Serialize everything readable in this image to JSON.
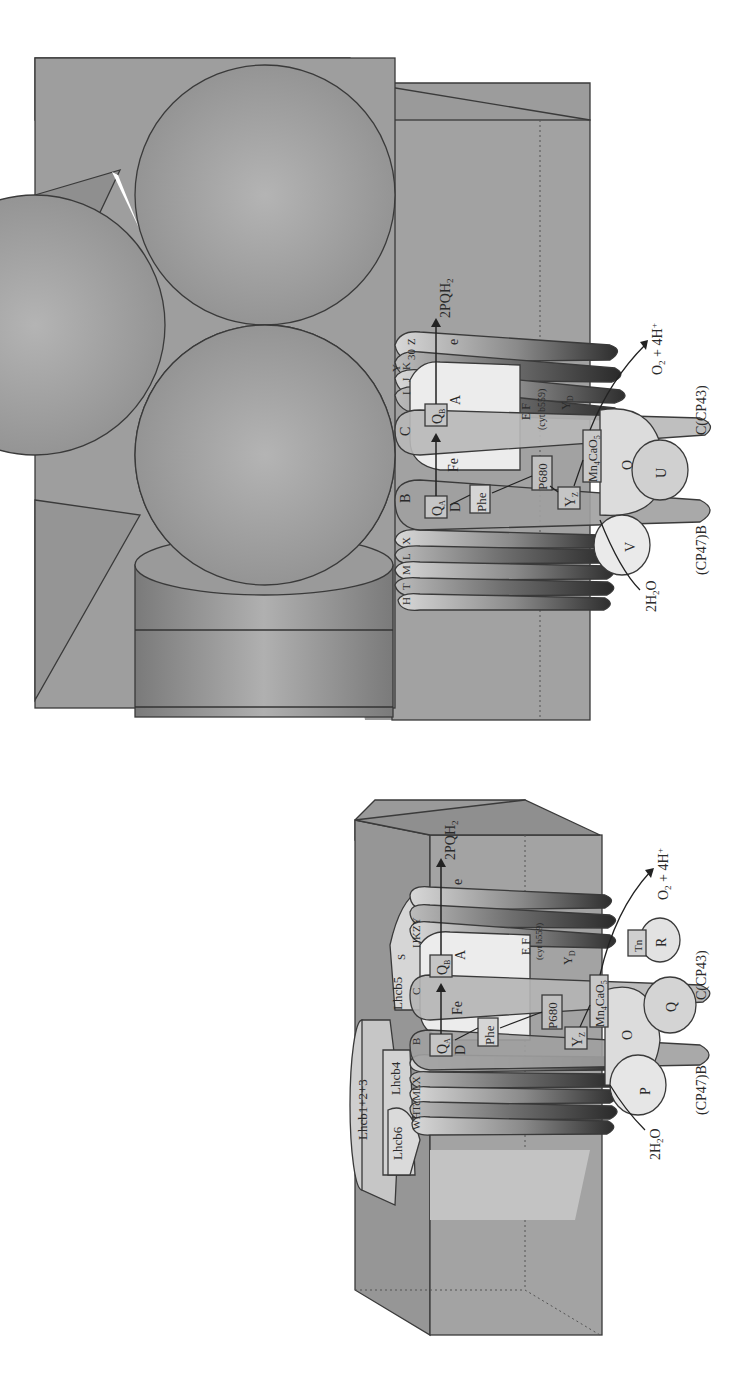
{
  "figure": {
    "orientation": "rotated-90-ccw",
    "panels": [
      {
        "id": "lower-panel",
        "title": "PSII core with LHCII antenna",
        "antenna_labels": [
          "Lhcb1+2+3",
          "Lhcb4",
          "Lhcb5",
          "Lhcb6"
        ],
        "subunit_labels": [
          "W",
          "H",
          "Tc",
          "M",
          "L",
          "X",
          "B",
          "C",
          "S",
          "I",
          "J",
          "K",
          "Z",
          "Y"
        ],
        "cofactor_labels": {
          "qa": "Q",
          "qa_sub": "A",
          "qb": "Q",
          "qb_sub": "B",
          "d2": "D",
          "d2_sub": "(D2)",
          "d1": "A",
          "d1_sub": "(D1)",
          "phe": "Phe",
          "fe": "Fe",
          "p680": "P680",
          "yz": "Y",
          "yz_sub": "Z",
          "yd": "Y",
          "yd_sub": "D",
          "mn": "Mn",
          "mn_sub": "4",
          "mn_rest": "CaO",
          "mn_rest_sub": "5",
          "electron": "e",
          "cytb559": "E F",
          "cytb559_sub": "(cyt b559)"
        },
        "extrinsic_labels": [
          "O",
          "P",
          "Q",
          "R",
          "Tn"
        ],
        "annotations": {
          "product": "2PQH",
          "product_sub": "2",
          "electron": "e",
          "water": "2H",
          "water_sub": "2",
          "water_end": "O",
          "oxygen": "O",
          "oxygen_sub": "2",
          "oxygen_end": " + 4H",
          "oxygen_sup": "+",
          "cp43": "C(CP43)",
          "cp47": "(CP47)B"
        }
      },
      {
        "id": "upper-panel",
        "title": "PSII core with bound spheres",
        "subunit_labels": [
          "H",
          "T",
          "M",
          "L",
          "X",
          "B",
          "C",
          "I",
          "J",
          "K",
          "30",
          "Y",
          "Z"
        ],
        "cofactor_labels": {
          "qa": "Q",
          "qa_sub": "A",
          "qb": "Q",
          "qb_sub": "B",
          "d2": "D",
          "d2_sub": "(D2)",
          "d1": "A",
          "d1_sub": "(D1)",
          "phe": "Phe",
          "fe": "Fe",
          "p680": "P680",
          "yz": "Y",
          "yz_sub": "Z",
          "yd": "Y",
          "yd_sub": "D",
          "mn": "Mn",
          "mn_sub": "4",
          "mn_rest": "CaO",
          "mn_rest_sub": "5",
          "electron": "e",
          "cytb559": "E F",
          "cytb559_sub": "(cyt b559)"
        },
        "extrinsic_labels": [
          "O",
          "U",
          "V"
        ],
        "annotations": {
          "product": "2PQH",
          "product_sub": "2",
          "electron": "e",
          "water": "2H",
          "water_sub": "2",
          "water_end": "O",
          "oxygen": "O",
          "oxygen_sub": "2",
          "oxygen_end": " + 4H",
          "oxygen_sup": "+",
          "cp43": "C(CP43)",
          "cp47": "(CP47)B"
        }
      }
    ],
    "colors": {
      "background": "#ffffff",
      "box_fill": "#9a9a9a",
      "box_dark": "#7d7d7d",
      "sphere_fill": "#a8a8a8",
      "helix_light": "#cfcfcf",
      "helix_dark": "#3c3c3c",
      "highlight": "#f2f2f2",
      "outline": "#3a3a3a"
    }
  }
}
